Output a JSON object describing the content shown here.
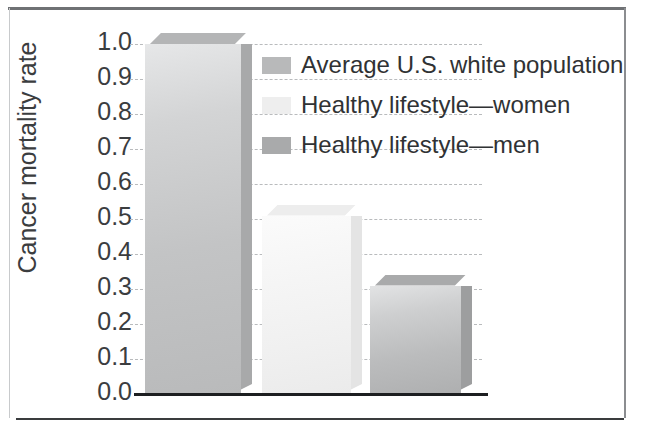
{
  "figure": {
    "frame": {
      "top_rule": "top-rule",
      "left_rule": "left-rule",
      "right_rule": "right-rule",
      "bottom_rule": "bottom-rule"
    }
  },
  "chart_data": {
    "type": "bar",
    "title": "",
    "xlabel": "",
    "ylabel": "Cancer mortality rate",
    "ylim": [
      0.0,
      1.0
    ],
    "grid": true,
    "grid_style": "dashed",
    "legend_position": "inside-top-right",
    "categories": [
      "Average U.S. white population",
      "Healthy lifestyle—women",
      "Healthy lifestyle—men"
    ],
    "values": [
      1.0,
      0.51,
      0.31
    ],
    "ytick_labels": [
      "1.0",
      "0.9",
      "0.8",
      "0.7",
      "0.6",
      "0.5",
      "0.4",
      "0.3",
      "0.2",
      "0.1",
      "0.0"
    ],
    "ytick_values": [
      1.0,
      0.9,
      0.8,
      0.7,
      0.6,
      0.5,
      0.4,
      0.3,
      0.2,
      0.1,
      0.0
    ],
    "series_colors": [
      "#c3c4c5",
      "#f0f0f0",
      "#bbbcbd"
    ],
    "legend": [
      {
        "label": "Average U.S. white population",
        "color": "#b8b9ba"
      },
      {
        "label": "Healthy lifestyle—women",
        "color": "#eeeeee"
      },
      {
        "label": "Healthy lifestyle—men",
        "color": "#a9aaab"
      }
    ],
    "axis_color": "#1d1f21",
    "gridline_color": "#b9bbbd"
  }
}
